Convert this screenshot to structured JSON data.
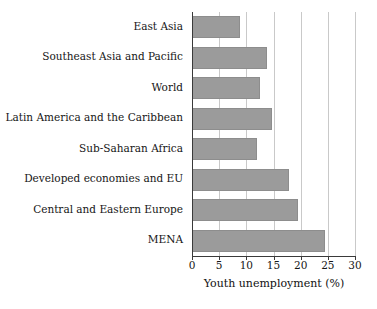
{
  "chart_data": {
    "type": "bar",
    "orientation": "horizontal",
    "title": "",
    "xlabel": "Youth unemployment (%)",
    "ylabel": "",
    "xlim": [
      0,
      30
    ],
    "xticks": [
      0,
      5,
      10,
      15,
      20,
      25,
      30
    ],
    "xticklabels": [
      "0",
      "5",
      "10",
      "15",
      "20",
      "25",
      "30"
    ],
    "grid": "vertical",
    "legend": null,
    "bar_color": "#9b9b9b",
    "axis_color": "#3a3a3a",
    "categories": [
      "East Asia",
      "Southeast Asia and Pacific",
      "World",
      "Latin America and the Caribbean",
      "Sub-Saharan Africa",
      "Developed economies and EU",
      "Central and Eastern Europe",
      "MENA"
    ],
    "values": [
      8.9,
      13.8,
      12.6,
      14.8,
      12.0,
      17.9,
      19.6,
      24.5
    ]
  }
}
